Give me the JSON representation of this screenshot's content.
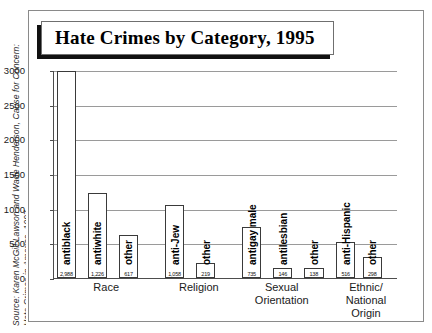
{
  "source": {
    "line1": "Source: Karen McGill Lawson and Wade Henderson, Cause for Concern:",
    "line2": "Hate Crimes in America, 1997."
  },
  "title": "Hate Crimes by Category, 1995",
  "chart_data": {
    "type": "bar",
    "title": "Hate Crimes by Category, 1995",
    "xlabel": "",
    "ylabel": "",
    "ylim": [
      0,
      3000
    ],
    "yticks": [
      "0",
      "500",
      "1000",
      "1500",
      "2000",
      "2500",
      "3000"
    ],
    "grid": true,
    "legend": "none",
    "categories": [
      "Race",
      "Religion",
      "Sexual Orientation",
      "Ethnic/ National Origin"
    ],
    "category_labels": [
      {
        "line1": "Race",
        "line2": ""
      },
      {
        "line1": "Religion",
        "line2": ""
      },
      {
        "line1": "Sexual",
        "line2": "Orientation"
      },
      {
        "line1": "Ethnic/",
        "line2": "National Origin"
      }
    ],
    "bars": [
      {
        "label": "antiblack",
        "value": 2988,
        "value_label": "2,988",
        "group": "Race"
      },
      {
        "label": "antiwhite",
        "value": 1226,
        "value_label": "1,226",
        "group": "Race"
      },
      {
        "label": "other",
        "value": 617,
        "value_label": "617",
        "group": "Race"
      },
      {
        "label": "anti-Jew",
        "value": 1058,
        "value_label": "1,058",
        "group": "Religion"
      },
      {
        "label": "other",
        "value": 219,
        "value_label": "219",
        "group": "Religion"
      },
      {
        "label": "antigay male",
        "value": 735,
        "value_label": "735",
        "group": "Sexual Orientation"
      },
      {
        "label": "antilesbian",
        "value": 146,
        "value_label": "146",
        "group": "Sexual Orientation"
      },
      {
        "label": "other",
        "value": 138,
        "value_label": "138",
        "group": "Sexual Orientation"
      },
      {
        "label": "anti-Hispanic",
        "value": 516,
        "value_label": "516",
        "group": "Ethnic/National Origin"
      },
      {
        "label": "other",
        "value": 298,
        "value_label": "298",
        "group": "Ethnic/National Origin"
      }
    ],
    "colors": {
      "bar_fill": "#ffffff",
      "bar_border": "#3a3a3a",
      "gridline": "#9a9a9a",
      "axis": "#4d4d4d",
      "frame": "#8a8a8a",
      "title_shadow": "#111111",
      "text": "#1a1a1a"
    }
  }
}
